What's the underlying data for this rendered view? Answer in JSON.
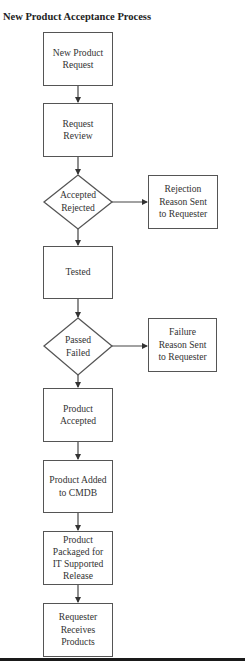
{
  "title": "New Product Acceptance Process",
  "nodes": {
    "new_product_request": "New Product\nRequest",
    "request_review": "Request\nReview",
    "decision_accept": "Accepted\nRejected",
    "rejection_reason": "Rejection\nReason Sent\nto Requester",
    "tested": "Tested",
    "decision_pass": "Passed\nFailed",
    "failure_reason": "Failure\nReason Sent\nto Requester",
    "product_accepted": "Product\nAccepted",
    "product_added_cmdb": "Product Added\nto CMDB",
    "product_packaged": "Product\nPackaged for\nIT Supported\nRelease",
    "requester_receives": "Requester\nReceives\nProducts"
  },
  "edges": [
    {
      "from": "new_product_request",
      "to": "request_review"
    },
    {
      "from": "request_review",
      "to": "decision_accept"
    },
    {
      "from": "decision_accept",
      "to": "rejection_reason"
    },
    {
      "from": "decision_accept",
      "to": "tested"
    },
    {
      "from": "tested",
      "to": "decision_pass"
    },
    {
      "from": "decision_pass",
      "to": "failure_reason"
    },
    {
      "from": "decision_pass",
      "to": "product_accepted"
    },
    {
      "from": "product_accepted",
      "to": "product_added_cmdb"
    },
    {
      "from": "product_added_cmdb",
      "to": "product_packaged"
    },
    {
      "from": "product_packaged",
      "to": "requester_receives"
    }
  ],
  "colors": {
    "stroke": "#555555",
    "text": "#333333",
    "rule": "#1a1a1a"
  }
}
